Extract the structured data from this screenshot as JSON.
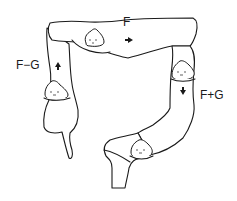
{
  "diagram": {
    "labels": {
      "transverse": "F",
      "ascending": "F−G",
      "descending": "F+G"
    },
    "segments": [
      {
        "name": "ascending-colon",
        "label": "F−G",
        "flow_arrow": "up"
      },
      {
        "name": "transverse-colon",
        "label": "F",
        "flow_arrow": "right"
      },
      {
        "name": "descending-colon",
        "label": "F+G",
        "flow_arrow": "down"
      },
      {
        "name": "sigmoid-rectum",
        "label": "",
        "flow_arrow": ""
      }
    ],
    "stool_markers": 4,
    "colors": {
      "stroke": "#1a1a1a",
      "background": "#ffffff"
    }
  }
}
